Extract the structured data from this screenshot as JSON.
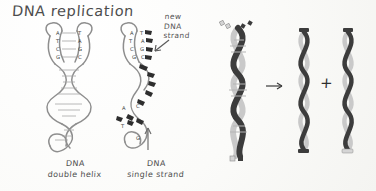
{
  "page": {
    "title": "DNA replication",
    "background_color": "#fdfdfb",
    "ink_color": "#4a4a4a"
  },
  "annotations": {
    "new_strand_label": "new\nDNA\nstrand",
    "new_strand_label_line1": "new",
    "new_strand_label_line2": "DNA",
    "new_strand_label_line3": "strand",
    "pointer_icon": "arrow-down-left-icon"
  },
  "captions": {
    "left_line1": "DNA",
    "left_line2": "double helix",
    "right_line1": "DNA",
    "right_line2": "single strand"
  },
  "diagrams": {
    "left_helix": {
      "name": "DNA double helix sketch",
      "base_pairs": [
        {
          "left": "A",
          "right": "T"
        },
        {
          "left": "T",
          "right": "A"
        },
        {
          "left": "C",
          "right": "G"
        },
        {
          "left": "G",
          "right": "C"
        }
      ]
    },
    "middle_helix": {
      "name": "DNA single strand replication sketch",
      "template_bases": [
        "A",
        "T",
        "C",
        "G"
      ],
      "new_bases": [
        "T",
        "A",
        "G",
        "C"
      ],
      "lower_bases": [
        "A",
        "C",
        "T",
        "G"
      ]
    },
    "right_illustration": {
      "name": "semiconservative replication illustration",
      "parent_label": "parent double helix",
      "daughter_1_label": "daughter helix",
      "daughter_2_label": "daughter helix",
      "operator": "+",
      "arrow_icon": "arrow-right-icon",
      "strand_dark_color": "#3a3a3a",
      "strand_light_color": "#c9c9c9"
    }
  }
}
